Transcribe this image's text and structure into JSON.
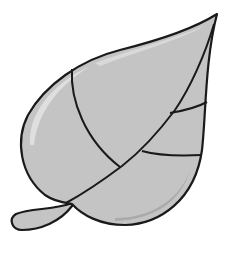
{
  "image": {
    "subject": "leaf illustration",
    "caption": "Gray leaf with black outline and veins",
    "colors": {
      "background": "#ffffff",
      "fill": "#c4c4c4",
      "outline": "#1a1a1a",
      "highlight": "#e6e6e6",
      "shadow": "#9a9a9a"
    }
  }
}
